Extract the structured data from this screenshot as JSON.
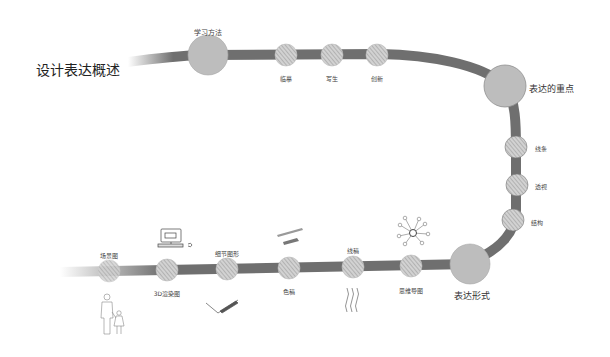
{
  "title": "设计表达概述",
  "colors": {
    "road": "#6f6f6f",
    "major_node": "#bdbdbd",
    "minor_node_fill": "#d6d6d6",
    "hatch": "#8a8a8a"
  },
  "sections": [
    {
      "label": "学习方法",
      "items": [
        "临摹",
        "写生",
        "创新"
      ]
    },
    {
      "label": "表达的重点",
      "items": [
        "线条",
        "透视",
        "结构"
      ]
    },
    {
      "label": "表达形式",
      "items": [
        "场景图",
        "3D渲染图",
        "细节图形",
        "色稿",
        "线稿",
        "思维导图"
      ]
    }
  ],
  "illustrations": [
    "people-sketch",
    "computer-sketch",
    "pen-sketch",
    "marker-sketch",
    "wavy-lines-sketch",
    "mind-map-sketch"
  ]
}
